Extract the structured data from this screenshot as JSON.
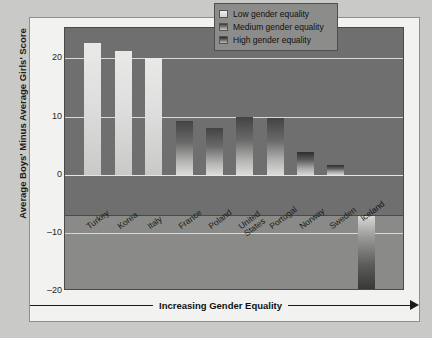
{
  "chart_data": {
    "type": "bar",
    "title": "",
    "subtitle": "",
    "xlabel": "Increasing Gender Equality",
    "ylabel": "Average Boys' Minus Average Girls' Score",
    "ylim": [
      -20,
      25
    ],
    "yticks": [
      20,
      10,
      0,
      -10,
      -20
    ],
    "ytick_labels": [
      "20",
      "10",
      "0",
      "–10",
      "–20"
    ],
    "grid": true,
    "legend_position": "top-right",
    "categories": [
      "Turkey",
      "Korea",
      "Italy",
      "France",
      "Poland",
      "United\nStates",
      "Portugal",
      "Norway",
      "Sweden",
      "Iceland"
    ],
    "bars": [
      {
        "label": "Turkey",
        "value": 22.7,
        "group": "low"
      },
      {
        "label": "Korea",
        "value": 21.2,
        "group": "low"
      },
      {
        "label": "Italy",
        "value": 20.0,
        "group": "low"
      },
      {
        "label": "France",
        "value": 9.3,
        "group": "med"
      },
      {
        "label": "Poland",
        "value": 8.0,
        "group": "med"
      },
      {
        "label": "United\nStates",
        "value": 10.0,
        "group": "med"
      },
      {
        "label": "Portugal",
        "value": 9.7,
        "group": "med"
      },
      {
        "label": "Norway",
        "value": 4.0,
        "group": "high"
      },
      {
        "label": "Sweden",
        "value": 1.8,
        "group": "high"
      },
      {
        "label": "Iceland",
        "value": -14.3,
        "group": "high"
      }
    ],
    "legend": [
      {
        "key": "low",
        "label": "Low gender equality"
      },
      {
        "key": "med",
        "label": "Medium gender equality"
      },
      {
        "key": "high",
        "label": "High gender equality"
      }
    ],
    "colors": {
      "plot_background": "#6f6f6f",
      "lower_background": "#8a8a88",
      "panel_background": "#f2f2f0",
      "page_background": "#c9c9c7",
      "gridline": "#d8d8d4",
      "axis_text": "#1a1a1a"
    }
  }
}
